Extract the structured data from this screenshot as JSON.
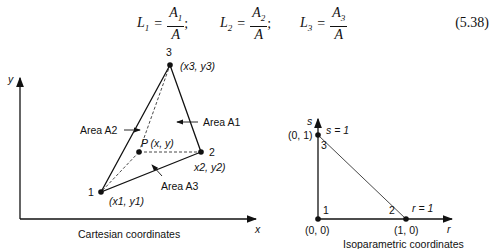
{
  "equation": {
    "terms": [
      {
        "lhs": "L",
        "lhs_sub": "1",
        "num": "A",
        "num_sub": "1",
        "den": "A",
        "sep": ";"
      },
      {
        "lhs": "L",
        "lhs_sub": "2",
        "num": "A",
        "num_sub": "2",
        "den": "A",
        "sep": ";"
      },
      {
        "lhs": "L",
        "lhs_sub": "3",
        "num": "A",
        "num_sub": "3",
        "den": "A",
        "sep": ""
      }
    ],
    "number": "(5.38)"
  },
  "cartesian": {
    "caption": "Cartesian coordinates",
    "x_axis_label": "x",
    "y_axis_label": "y",
    "nodes": [
      {
        "id": "1",
        "coord": "(x1, y1)"
      },
      {
        "id": "2",
        "coord": "x2, y2)"
      },
      {
        "id": "3",
        "coord": "(x3, y3)"
      }
    ],
    "point_label": "P (x, y)",
    "areas": [
      "Area A2",
      "Area A1",
      "Area A3"
    ]
  },
  "isoparametric": {
    "caption": "Isoparametric coordinates",
    "r_axis_label": "r",
    "s_axis_label": "s",
    "nodes": [
      {
        "id": "1",
        "coord": "(0, 0)"
      },
      {
        "id": "2",
        "coord": "(1, 0)"
      },
      {
        "id": "3",
        "coord": "(0, 1)"
      }
    ],
    "s_line_label": "s = 1",
    "r_line_label": "r = 1"
  }
}
